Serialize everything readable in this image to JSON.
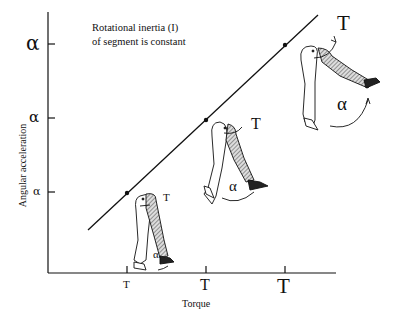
{
  "annotation": {
    "line1": "Rotational inertia (I)",
    "line2": "of segment is constant"
  },
  "axes": {
    "x_label": "Torque",
    "y_label": "Angular acceleration",
    "x_ticks": [
      "T",
      "T",
      "T"
    ],
    "y_ticks": [
      "α",
      "α",
      "α"
    ],
    "x_tick_sizes": [
      "small",
      "medium",
      "large"
    ],
    "y_tick_sizes": [
      "small",
      "medium",
      "large"
    ]
  },
  "figures": [
    {
      "name": "small",
      "torque_label": "T",
      "accel_label": "α"
    },
    {
      "name": "medium",
      "torque_label": "T",
      "accel_label": "α"
    },
    {
      "name": "large",
      "torque_label": "T",
      "accel_label": "α"
    }
  ],
  "relationship": "linear, direct proportion (T = Iα)",
  "colors": {
    "ink": "#111111",
    "background": "#ffffff",
    "hatch": "#555555"
  }
}
